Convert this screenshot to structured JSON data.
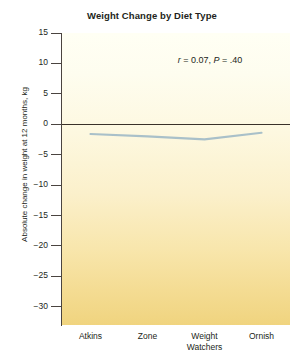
{
  "chart_data": {
    "type": "line",
    "title": "Weight Change by Diet Type",
    "xlabel": "",
    "ylabel": "Absolute change in weight at 12 months, kg",
    "categories": [
      "Atkins",
      "Zone",
      "Weight Watchers",
      "Ornish"
    ],
    "category_lines": [
      [
        "Atkins"
      ],
      [
        "Zone"
      ],
      [
        "Weight",
        "Watchers"
      ],
      [
        "Ornish"
      ]
    ],
    "values": [
      -1.6,
      -2.0,
      -2.5,
      -1.4
    ],
    "series": [
      {
        "name": "Absolute change in weight at 12 months, kg",
        "values": [
          -1.6,
          -2.0,
          -2.5,
          -1.4
        ]
      }
    ],
    "ylim": [
      -33,
      15
    ],
    "yticks": [
      15,
      10,
      5,
      0,
      -5,
      -10,
      -15,
      -20,
      -25,
      -30
    ],
    "ytick_labels": [
      "15",
      "10",
      "5",
      "0",
      "−5",
      "−10",
      "−15",
      "−20",
      "−25",
      "−30"
    ],
    "grid": false,
    "legend": "none",
    "zero_reference_line": 0,
    "annotations": [
      {
        "name": "correlation-stats",
        "text": "r = 0.07, P = .40",
        "parts": [
          {
            "text": "r",
            "italic": true
          },
          {
            "text": " = 0.07, ",
            "italic": false
          },
          {
            "text": "P",
            "italic": true
          },
          {
            "text": " = .40",
            "italic": false
          }
        ]
      }
    ],
    "colors": {
      "line": "#a9c0c9",
      "zero_line": "#3a3129",
      "axis": "#4a4440",
      "plot_bg_top": "#fffff4",
      "plot_bg_bottom": "#f0d47f",
      "text": "#231f20"
    }
  }
}
